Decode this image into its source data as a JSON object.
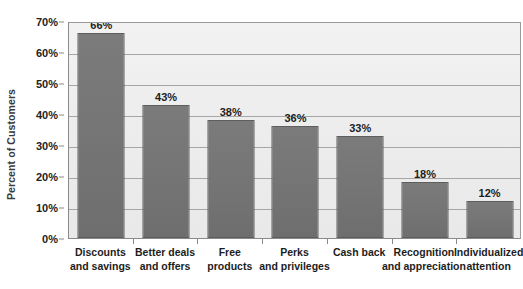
{
  "chart_data": {
    "type": "bar",
    "title": "",
    "subtitle": "",
    "xlabel": "",
    "ylabel": "Percent of Customers",
    "ylim": [
      0,
      70
    ],
    "ytick_step": 10,
    "grid": true,
    "legend": "none",
    "value_labels_shown": true,
    "categories": [
      "Discounts and savings",
      "Better deals and offers",
      "Free products",
      "Perks and privileges",
      "Cash back",
      "Recognition and appreciation",
      "Individualized attention"
    ],
    "category_lines": [
      [
        "Discounts",
        "and savings"
      ],
      [
        "Better deals",
        "and offers"
      ],
      [
        "Free",
        "products"
      ],
      [
        "Perks",
        "and privileges"
      ],
      [
        "Cash back",
        ""
      ],
      [
        "Recognition",
        "and appreciation"
      ],
      [
        "Individualized",
        "attention"
      ]
    ],
    "values": [
      66,
      43,
      38,
      36,
      33,
      18,
      12
    ],
    "value_labels": [
      "66%",
      "43%",
      "38%",
      "36%",
      "33%",
      "18%",
      "12%"
    ],
    "ytick_labels": [
      "0%",
      "10%",
      "20%",
      "30%",
      "40%",
      "50%",
      "60%",
      "70%"
    ],
    "ytick_values": [
      0,
      10,
      20,
      30,
      40,
      50,
      60,
      70
    ]
  },
  "colors": {
    "bar_fill": "#757575",
    "bar_border": "#5e5e5e",
    "plot_background": "#eeeeee",
    "gridline": "#a6a6a6",
    "axis": "#8a8a8a",
    "text": "#1d1d1d",
    "page_background": "#ffffff"
  }
}
